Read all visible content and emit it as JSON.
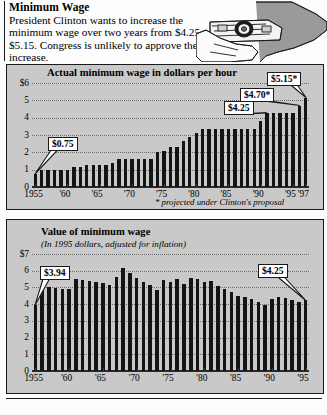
{
  "header": {
    "title": "Minimum Wage",
    "body": "President Clinton wants to increase the minimum wage over two years from $4.25 to $5.15. Congress is unlikely to approve the increase.",
    "illustration": "hand-holding-money-icon"
  },
  "chart_top": {
    "title": "Actual minimum wage in dollars per hour",
    "footnote": "* projected under Clinton's proposal",
    "ylabels": [
      "$6",
      "5",
      "4",
      "3",
      "2",
      "1",
      "0"
    ],
    "xlabels": [
      "1955",
      "'60",
      "'65",
      "'70",
      "'75",
      "'80",
      "'85",
      "'90",
      "'95",
      "'97"
    ],
    "callouts": [
      {
        "label": "$0.75",
        "year": 1955
      },
      {
        "label": "$4.25",
        "year": 1991
      },
      {
        "label": "$4.70*",
        "year": 1996
      },
      {
        "label": "$5.15*",
        "year": 1997
      }
    ]
  },
  "chart_bottom": {
    "title": "Value of minimum wage",
    "subtitle": "(In 1995 dollars, adjusted for inflation)",
    "ylabels": [
      "$7",
      "6",
      "5",
      "4",
      "3",
      "2",
      "1",
      "0"
    ],
    "xlabels": [
      "1955",
      "'60",
      "'65",
      "'70",
      "'75",
      "'80",
      "'85",
      "'90",
      "'95"
    ],
    "callouts": [
      {
        "label": "$3.94",
        "year": 1955
      },
      {
        "label": "$4.25",
        "year": 1995
      }
    ]
  },
  "chart_data": [
    {
      "type": "bar",
      "id": "actual-minimum-wage",
      "title": "Actual minimum wage in dollars per hour",
      "xlabel": "",
      "ylabel": "dollars per hour",
      "ylim": [
        0,
        6
      ],
      "yticks": [
        0,
        1,
        2,
        3,
        4,
        5,
        6
      ],
      "ytick_labels": [
        "0",
        "1",
        "2",
        "3",
        "4",
        "5",
        "$6"
      ],
      "grid": true,
      "legend": "none",
      "annotation": "* projected under Clinton's proposal",
      "categories": [
        1955,
        1956,
        1957,
        1958,
        1959,
        1960,
        1961,
        1962,
        1963,
        1964,
        1965,
        1966,
        1967,
        1968,
        1969,
        1970,
        1971,
        1972,
        1973,
        1974,
        1975,
        1976,
        1977,
        1978,
        1979,
        1980,
        1981,
        1982,
        1983,
        1984,
        1985,
        1986,
        1987,
        1988,
        1989,
        1990,
        1991,
        1992,
        1993,
        1994,
        1995,
        1996,
        1997
      ],
      "values": [
        0.75,
        1.0,
        1.0,
        1.0,
        1.0,
        1.0,
        1.15,
        1.15,
        1.25,
        1.25,
        1.25,
        1.25,
        1.4,
        1.6,
        1.6,
        1.6,
        1.6,
        1.6,
        1.6,
        2.0,
        2.1,
        2.3,
        2.3,
        2.65,
        2.9,
        3.1,
        3.35,
        3.35,
        3.35,
        3.35,
        3.35,
        3.35,
        3.35,
        3.35,
        3.35,
        3.8,
        4.25,
        4.25,
        4.25,
        4.25,
        4.25,
        4.7,
        5.15
      ]
    },
    {
      "type": "bar",
      "id": "value-of-minimum-wage-1995-dollars",
      "title": "Value of minimum wage",
      "subtitle": "(In 1995 dollars, adjusted for inflation)",
      "xlabel": "",
      "ylabel": "1995 dollars",
      "ylim": [
        0,
        7
      ],
      "yticks": [
        0,
        1,
        2,
        3,
        4,
        5,
        6,
        7
      ],
      "ytick_labels": [
        "0",
        "1",
        "2",
        "3",
        "4",
        "5",
        "6",
        "$7"
      ],
      "grid": true,
      "legend": "none",
      "categories": [
        1955,
        1956,
        1957,
        1958,
        1959,
        1960,
        1961,
        1962,
        1963,
        1964,
        1965,
        1966,
        1967,
        1968,
        1969,
        1970,
        1971,
        1972,
        1973,
        1974,
        1975,
        1976,
        1977,
        1978,
        1979,
        1980,
        1981,
        1982,
        1983,
        1984,
        1985,
        1986,
        1987,
        1988,
        1989,
        1990,
        1991,
        1992,
        1993,
        1994,
        1995
      ],
      "values": [
        3.94,
        5.1,
        5.05,
        4.95,
        4.9,
        4.88,
        5.5,
        5.45,
        5.4,
        5.35,
        5.25,
        5.15,
        5.6,
        6.15,
        5.85,
        5.55,
        5.3,
        5.15,
        4.85,
        5.45,
        5.3,
        5.5,
        5.2,
        5.55,
        5.5,
        5.35,
        5.4,
        5.1,
        4.9,
        4.7,
        4.5,
        4.45,
        4.3,
        4.1,
        3.95,
        4.3,
        4.45,
        4.35,
        4.25,
        4.15,
        4.25
      ]
    }
  ]
}
